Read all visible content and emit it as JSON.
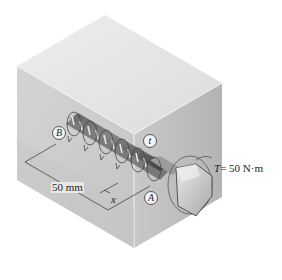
{
  "figure": {
    "type": "engineering-diagram",
    "labels": {
      "point_b": "B",
      "point_a": "A",
      "distributed_torque": "t",
      "position_variable": "x",
      "length_dimension": "50 mm",
      "applied_torque_symbol": "T",
      "applied_torque_value": "= 50 N·m"
    },
    "colors": {
      "block_top": "#e6e6e6",
      "block_front": "#cfcfcf",
      "block_side": "#bdbdbd",
      "bolt_dark": "#3a3a3a",
      "bolt_light": "#d8d8d8",
      "line": "#333333"
    }
  }
}
